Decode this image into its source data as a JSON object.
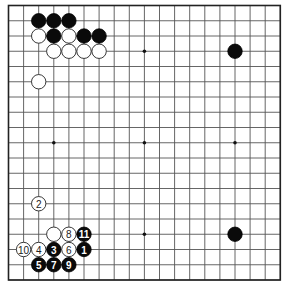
{
  "board": {
    "size": 19,
    "origin_x": 8.5,
    "origin_y": 5.5,
    "spacing_x": 15.1,
    "spacing_y": 15.25,
    "stone_radius": 7.2,
    "colors": {
      "black": "#0a0a0a",
      "white": "#ffffff",
      "line": "#555555"
    }
  },
  "star_points": [
    {
      "col": 3,
      "row": 3
    },
    {
      "col": 9,
      "row": 3
    },
    {
      "col": 15,
      "row": 3
    },
    {
      "col": 3,
      "row": 9
    },
    {
      "col": 9,
      "row": 9
    },
    {
      "col": 15,
      "row": 9
    },
    {
      "col": 3,
      "row": 15
    },
    {
      "col": 9,
      "row": 15
    },
    {
      "col": 15,
      "row": 15
    }
  ],
  "stones": [
    {
      "color": "black",
      "col": 2,
      "row": 1,
      "label": ""
    },
    {
      "color": "black",
      "col": 3,
      "row": 1,
      "label": ""
    },
    {
      "color": "black",
      "col": 4,
      "row": 1,
      "label": ""
    },
    {
      "color": "white",
      "col": 2,
      "row": 2,
      "label": ""
    },
    {
      "color": "black",
      "col": 3,
      "row": 2,
      "label": ""
    },
    {
      "color": "white",
      "col": 4,
      "row": 2,
      "label": ""
    },
    {
      "color": "black",
      "col": 5,
      "row": 2,
      "label": ""
    },
    {
      "color": "black",
      "col": 6,
      "row": 2,
      "label": ""
    },
    {
      "color": "white",
      "col": 3,
      "row": 3,
      "label": ""
    },
    {
      "color": "white",
      "col": 4,
      "row": 3,
      "label": ""
    },
    {
      "color": "white",
      "col": 5,
      "row": 3,
      "label": ""
    },
    {
      "color": "white",
      "col": 6,
      "row": 3,
      "label": ""
    },
    {
      "color": "white",
      "col": 2,
      "row": 5,
      "label": ""
    },
    {
      "color": "black",
      "col": 15,
      "row": 3,
      "label": ""
    },
    {
      "color": "black",
      "col": 15,
      "row": 15,
      "label": ""
    },
    {
      "color": "white",
      "col": 2,
      "row": 13,
      "label": "2"
    },
    {
      "color": "white",
      "col": 3,
      "row": 15,
      "label": ""
    },
    {
      "color": "white",
      "col": 4,
      "row": 15,
      "label": "8"
    },
    {
      "color": "black",
      "col": 5,
      "row": 15,
      "label": "11"
    },
    {
      "color": "white",
      "col": 1,
      "row": 16,
      "label": "10"
    },
    {
      "color": "white",
      "col": 2,
      "row": 16,
      "label": "4"
    },
    {
      "color": "black",
      "col": 3,
      "row": 16,
      "label": "3"
    },
    {
      "color": "white",
      "col": 4,
      "row": 16,
      "label": "6"
    },
    {
      "color": "black",
      "col": 5,
      "row": 16,
      "label": "1"
    },
    {
      "color": "black",
      "col": 2,
      "row": 17,
      "label": "5"
    },
    {
      "color": "black",
      "col": 3,
      "row": 17,
      "label": "7"
    },
    {
      "color": "black",
      "col": 4,
      "row": 17,
      "label": "9"
    }
  ]
}
